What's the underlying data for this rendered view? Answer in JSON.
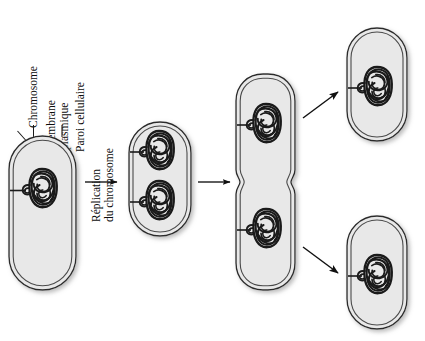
{
  "diagram": {
    "language": "fr",
    "colors": {
      "cell_fill": "#e8e8e8",
      "cell_stroke": "#2b2b2b",
      "membrane_stroke": "#3a3a3a",
      "chromosome": "#1a1a1a",
      "arrow": "#111111",
      "shadow": "#c9c9c9",
      "background": "#ffffff"
    }
  },
  "labels": {
    "chromosome": "Chromosome",
    "membrane_line1": "Membrane",
    "membrane_line2": "plasmique",
    "wall": "Paroi cellulaire",
    "replication_line1": "Réplication",
    "replication_line2": "du chromosome"
  },
  "stages": [
    {
      "id": "stage-1-parent-cell",
      "name": "parent-cell",
      "chromosome_count": 1,
      "septum": false
    },
    {
      "id": "stage-2-replicated-cell",
      "name": "replicated-cell",
      "chromosome_count": 2,
      "septum": false
    },
    {
      "id": "stage-3-dividing-cell",
      "name": "dividing-cell",
      "chromosome_count": 2,
      "septum": true
    },
    {
      "id": "stage-4-daughter-cell-top",
      "name": "daughter-cell-top",
      "chromosome_count": 1,
      "septum": false
    },
    {
      "id": "stage-5-daughter-cell-bottom",
      "name": "daughter-cell-bottom",
      "chromosome_count": 1,
      "septum": false
    }
  ],
  "arrows": [
    {
      "id": "arrow-replication",
      "direction": "right"
    },
    {
      "id": "arrow-division",
      "direction": "right"
    },
    {
      "id": "arrow-separation-top",
      "direction": "up-right"
    },
    {
      "id": "arrow-separation-bottom",
      "direction": "down-right"
    }
  ],
  "leader_lines": [
    {
      "id": "leader-chromosome",
      "target": "chromosome"
    },
    {
      "id": "leader-membrane",
      "target": "plasma-membrane"
    },
    {
      "id": "leader-wall",
      "target": "cell-wall"
    }
  ]
}
